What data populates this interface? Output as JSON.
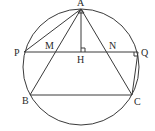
{
  "diagram": {
    "labels": {
      "A": "A",
      "P": "P",
      "M": "M",
      "H": "H",
      "N": "N",
      "Q": "Q",
      "B": "B",
      "C": "C"
    },
    "segments": [
      "AB",
      "AC",
      "BC",
      "AP",
      "AH",
      "PQ",
      "QC"
    ],
    "right_angles": [
      "AHQ",
      "PQC"
    ],
    "colors": {
      "stroke": "#3a3a3a",
      "text": "#2a2a2a",
      "background": "#ffffff"
    }
  }
}
